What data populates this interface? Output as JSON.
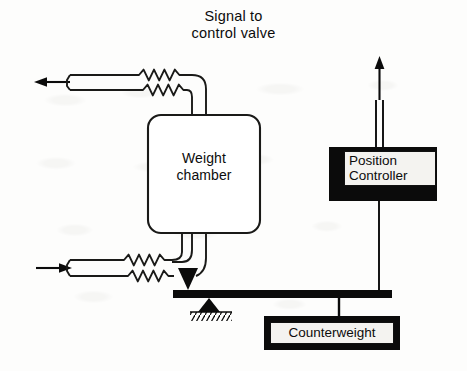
{
  "diagram": {
    "background_color": "#fdfdfc",
    "ink_color": "#0b0b0b",
    "label_fill_color": "#f4f3f0"
  },
  "captions": {
    "signal": {
      "line1": "Signal to",
      "line2": "control valve"
    },
    "weight_chamber": {
      "line1": "Weight",
      "line2": "chamber"
    },
    "position_controller": {
      "line1": "Position",
      "line2": "Controller"
    },
    "counterweight": {
      "label": "Counterweight"
    }
  },
  "components": [
    {
      "name": "weight-chamber",
      "type": "rounded-vessel",
      "label": "Weight chamber",
      "x": 148,
      "y": 115,
      "width": 112,
      "height": 118
    },
    {
      "name": "position-controller",
      "type": "filled-block",
      "label": "Position Controller",
      "x": 329,
      "y": 147,
      "width": 108,
      "height": 54
    },
    {
      "name": "counterweight",
      "type": "filled-block",
      "label": "Counterweight",
      "x": 264,
      "y": 316,
      "width": 136,
      "height": 34
    },
    {
      "name": "balance-beam",
      "type": "lever",
      "x": 173,
      "y": 290,
      "width": 219,
      "height": 8
    },
    {
      "name": "fulcrum",
      "type": "knife-edge-pivot",
      "x": 207,
      "y": 298
    },
    {
      "name": "ground-hatch",
      "type": "ground-symbol",
      "x": 190,
      "y": 312,
      "width": 42
    },
    {
      "name": "load-knife-edge",
      "type": "knife-edge",
      "x": 188,
      "y": 277
    },
    {
      "name": "outlet-pipe-top",
      "type": "flexible-pipe",
      "flow": "out"
    },
    {
      "name": "inlet-pipe-bottom",
      "type": "flexible-pipe",
      "flow": "in"
    },
    {
      "name": "signal-line",
      "type": "pneumatic-tube",
      "flow": "out"
    },
    {
      "name": "controller-link",
      "type": "linkage-rod"
    }
  ],
  "flow_arrows": [
    {
      "name": "outlet-arrow",
      "direction": "left",
      "x": 36,
      "y": 82
    },
    {
      "name": "inlet-arrow",
      "direction": "right",
      "x": 36,
      "y": 268
    },
    {
      "name": "signal-arrow",
      "direction": "up",
      "x": 381,
      "y": 62
    }
  ]
}
